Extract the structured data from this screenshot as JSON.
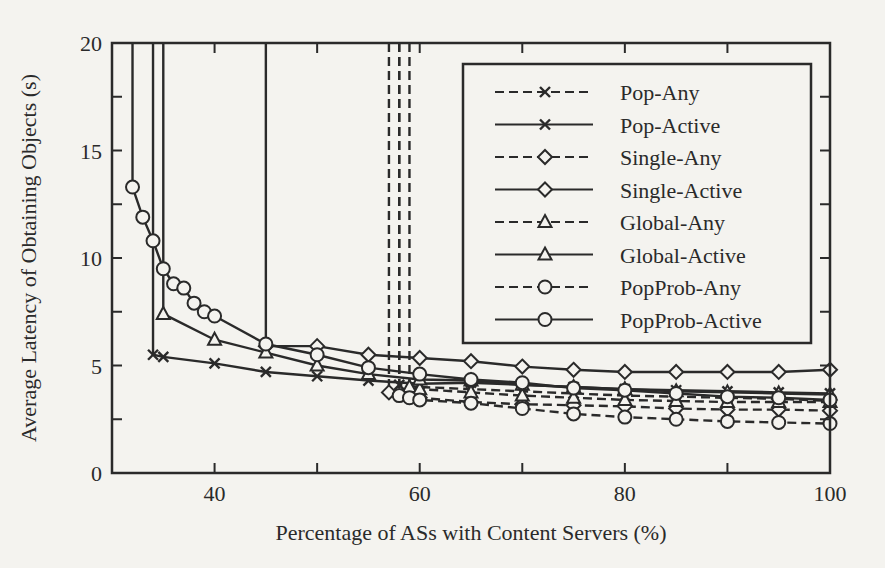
{
  "chart_data": {
    "type": "line",
    "title": "",
    "xlabel": "Percentage of ASs with Content Servers (%)",
    "ylabel": "Average Latency of Obtaining Objects (s)",
    "xlim": [
      30,
      100
    ],
    "ylim": [
      0,
      20
    ],
    "x_ticks": [
      40,
      60,
      80,
      100
    ],
    "x_minor_ticks": [
      50,
      70,
      90
    ],
    "y_ticks": [
      0,
      5,
      10,
      15,
      20
    ],
    "y_minor_ticks": [
      2.5,
      7.5,
      12.5,
      17.5
    ],
    "grid": false,
    "legend_position": "upper right",
    "series": [
      {
        "name": "Pop-Any",
        "style": "dashed",
        "marker": "x",
        "x": [
          58,
          58,
          60,
          65,
          70,
          75,
          80,
          85,
          90,
          95,
          100
        ],
        "y": [
          20,
          4.1,
          4.0,
          3.9,
          3.8,
          3.7,
          3.6,
          3.55,
          3.5,
          3.45,
          3.35
        ]
      },
      {
        "name": "Pop-Active",
        "style": "solid",
        "marker": "x",
        "x": [
          34,
          34,
          35,
          40,
          45,
          50,
          55,
          60,
          65,
          70,
          75,
          80,
          85,
          90,
          95,
          100
        ],
        "y": [
          20,
          5.5,
          5.4,
          5.1,
          4.7,
          4.5,
          4.3,
          4.15,
          4.2,
          4.1,
          4.0,
          3.9,
          3.85,
          3.8,
          3.75,
          3.7
        ]
      },
      {
        "name": "Single-Any",
        "style": "dashed",
        "marker": "diamond",
        "x": [
          57,
          57,
          60,
          65,
          70,
          75,
          80,
          85,
          90,
          95,
          100
        ],
        "y": [
          20,
          3.75,
          3.5,
          3.3,
          3.2,
          3.15,
          3.1,
          3.0,
          2.95,
          2.95,
          2.9
        ]
      },
      {
        "name": "Single-Active",
        "style": "solid",
        "marker": "diamond",
        "x": [
          45,
          45,
          50,
          55,
          60,
          65,
          70,
          75,
          80,
          85,
          90,
          95,
          100
        ],
        "y": [
          20,
          5.9,
          5.9,
          5.5,
          5.35,
          5.2,
          4.95,
          4.8,
          4.7,
          4.7,
          4.7,
          4.7,
          4.8
        ]
      },
      {
        "name": "Global-Any",
        "style": "dashed",
        "marker": "triangle",
        "x": [
          59,
          59,
          60,
          65,
          70,
          75,
          80,
          85,
          90,
          95,
          100
        ],
        "y": [
          20,
          4.0,
          3.9,
          3.75,
          3.6,
          3.5,
          3.4,
          3.35,
          3.3,
          3.3,
          3.3
        ]
      },
      {
        "name": "Global-Active",
        "style": "solid",
        "marker": "triangle",
        "x": [
          35,
          35,
          40,
          45,
          50,
          55,
          60,
          65,
          70,
          75,
          80,
          85,
          90,
          95,
          100
        ],
        "y": [
          20,
          7.4,
          6.2,
          5.6,
          5.0,
          4.6,
          4.35,
          4.3,
          4.1,
          4.0,
          3.9,
          3.8,
          3.75,
          3.7,
          3.65
        ]
      },
      {
        "name": "PopProb-Any",
        "style": "dashed",
        "marker": "circle",
        "x": [
          58,
          58,
          59,
          60,
          65,
          70,
          75,
          80,
          85,
          90,
          95,
          100
        ],
        "y": [
          20,
          3.6,
          3.5,
          3.4,
          3.25,
          3.0,
          2.75,
          2.6,
          2.5,
          2.4,
          2.35,
          2.3
        ]
      },
      {
        "name": "PopProb-Active",
        "style": "solid",
        "marker": "circle",
        "x": [
          32,
          32,
          33,
          34,
          35,
          36,
          37,
          38,
          39,
          40,
          45,
          50,
          55,
          60,
          65,
          70,
          75,
          80,
          85,
          90,
          95,
          100
        ],
        "y": [
          20,
          13.3,
          11.9,
          10.8,
          9.5,
          8.8,
          8.6,
          7.9,
          7.5,
          7.3,
          6.0,
          5.5,
          4.9,
          4.6,
          4.35,
          4.2,
          3.95,
          3.85,
          3.7,
          3.55,
          3.5,
          3.4
        ]
      }
    ]
  },
  "legend": {
    "items": [
      {
        "label": "Pop-Any"
      },
      {
        "label": "Pop-Active"
      },
      {
        "label": "Single-Any"
      },
      {
        "label": "Single-Active"
      },
      {
        "label": "Global-Any"
      },
      {
        "label": "Global-Active"
      },
      {
        "label": "PopProb-Any"
      },
      {
        "label": "PopProb-Active"
      }
    ]
  },
  "colors": {
    "ink": "#2a2a2a",
    "paper": "#f4f3ef"
  }
}
